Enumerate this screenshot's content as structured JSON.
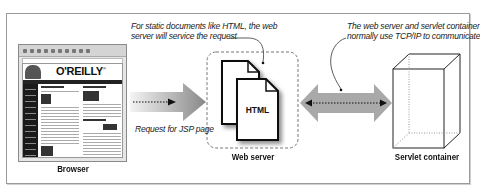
{
  "diagram": {
    "nodes": {
      "browser": {
        "label": "Browser"
      },
      "web_server": {
        "label": "Web server",
        "document_label": "HTML"
      },
      "servlet_container": {
        "label": "Servlet container"
      }
    },
    "browser_screenshot": {
      "logo_text": "O'REILLY",
      "logo_mark": "®"
    },
    "annotations": {
      "static_docs": {
        "line1": "For static documents like HTML, the web",
        "line2": "server will service the request"
      },
      "tcp_ip": {
        "line1": "The web server and servlet container",
        "line2": "normally use TCP/IP to communicate"
      },
      "request": "Request for JSP page"
    },
    "edges": [
      {
        "from": "browser",
        "to": "web_server",
        "style": "one-way gradient arrow",
        "label": "Request for JSP page"
      },
      {
        "from": "web_server",
        "to": "servlet_container",
        "style": "two-way arrow",
        "label": "TCP/IP"
      }
    ],
    "colors": {
      "arrow_light": "#f0f0f0",
      "arrow_dark": "#8c8c8c",
      "double_arrow": "#a8a8a8",
      "frame": "#9a9a9a",
      "ink": "#111111"
    }
  }
}
